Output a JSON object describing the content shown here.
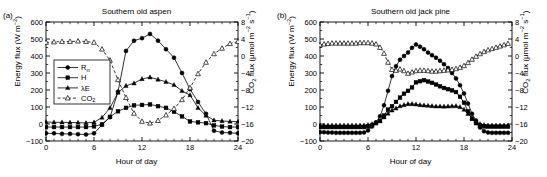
{
  "figure": {
    "panels": [
      {
        "label": "(a)",
        "title": "Southern old aspen",
        "xlabel": "Hour of day",
        "ylabel_left": "Energy flux (W m⁻²)",
        "ylabel_right": "CO₂ flux (μmol m⁻² s⁻¹)",
        "legend": [
          {
            "key": "Rn",
            "label": "R",
            "sub": "n",
            "marker": "circle",
            "line": "solid"
          },
          {
            "key": "H",
            "label": "H",
            "sub": "",
            "marker": "square",
            "line": "solid"
          },
          {
            "key": "LE",
            "label": "λE",
            "sub": "",
            "marker": "triangle",
            "line": "solid"
          },
          {
            "key": "CO2",
            "label": "CO",
            "sub": "2",
            "marker": "open-triangle",
            "line": "dashed"
          }
        ]
      },
      {
        "label": "(b)",
        "title": "Southern old jack pine",
        "xlabel": "Hour of day",
        "ylabel_left": "Energy flux (W m⁻²)",
        "ylabel_right": "CO₂ flux (μmol m⁻² s⁻¹)",
        "legend": []
      }
    ],
    "xticks": [
      0,
      6,
      12,
      18,
      24
    ],
    "yticks_left": [
      -100,
      0,
      100,
      200,
      300,
      400,
      500,
      600
    ],
    "yticks_right": [
      -20,
      -16,
      -12,
      -8,
      -4,
      0,
      4,
      8
    ],
    "colors": {
      "line": "#000000",
      "axis": "#000000",
      "background": "#ffffff"
    }
  },
  "chart_data": [
    {
      "type": "line",
      "panel": "a",
      "title": "Southern old aspen",
      "xlabel": "Hour of day",
      "ylabel": "Energy flux (W m⁻²)",
      "ylabel2": "CO₂ flux (μmol m⁻² s⁻¹)",
      "xlim": [
        0,
        24
      ],
      "ylim": [
        -100,
        600
      ],
      "ylim2": [
        -20,
        8
      ],
      "grid": false,
      "legend_position": "upper-left-inset",
      "x": [
        0,
        1,
        2,
        3,
        4,
        5,
        6,
        7,
        8,
        9,
        10,
        11,
        12,
        13,
        14,
        15,
        16,
        17,
        18,
        19,
        20,
        21,
        22,
        23,
        24
      ],
      "series": [
        {
          "name": "Rn",
          "axis": "left",
          "marker": "filled-circle",
          "line": "solid",
          "values": [
            -55,
            -55,
            -58,
            -58,
            -60,
            -62,
            -55,
            -5,
            40,
            190,
            430,
            490,
            505,
            530,
            490,
            440,
            390,
            300,
            205,
            130,
            60,
            -40,
            -50,
            -52,
            -55
          ]
        },
        {
          "name": "H",
          "axis": "left",
          "marker": "filled-square",
          "line": "solid",
          "values": [
            -18,
            -18,
            -18,
            -18,
            -18,
            -18,
            -14,
            -2,
            42,
            75,
            95,
            110,
            112,
            115,
            105,
            95,
            72,
            45,
            15,
            10,
            5,
            -8,
            -15,
            -18,
            -18
          ]
        },
        {
          "name": "λE",
          "axis": "left",
          "marker": "filled-triangle",
          "line": "solid",
          "values": [
            12,
            10,
            10,
            9,
            8,
            6,
            10,
            38,
            95,
            185,
            225,
            240,
            265,
            275,
            262,
            248,
            230,
            195,
            170,
            95,
            50,
            22,
            18,
            15,
            14
          ]
        },
        {
          "name": "CO₂",
          "axis": "right",
          "marker": "open-triangle",
          "line": "dashed",
          "values": [
            3.2,
            3.3,
            3.4,
            3.4,
            3.5,
            3.4,
            3.2,
            1.6,
            -1.0,
            -5.6,
            -9.8,
            -13.5,
            -15.4,
            -15.8,
            -15.2,
            -13.9,
            -12.4,
            -10.3,
            -7.5,
            -4.2,
            -1.5,
            0.5,
            1.8,
            2.9,
            3.4
          ]
        }
      ]
    },
    {
      "type": "line",
      "panel": "b",
      "title": "Southern old jack pine",
      "xlabel": "Hour of day",
      "ylabel": "Energy flux (W m⁻²)",
      "ylabel2": "CO₂ flux (μmol m⁻² s⁻¹)",
      "xlim": [
        0,
        24
      ],
      "ylim": [
        -100,
        600
      ],
      "ylim2": [
        -20,
        8
      ],
      "grid": false,
      "legend_position": "none",
      "x": [
        0,
        0.5,
        1,
        1.5,
        2,
        2.5,
        3,
        3.5,
        4,
        4.5,
        5,
        5.5,
        6,
        6.5,
        7,
        7.5,
        8,
        8.5,
        9,
        9.5,
        10,
        10.5,
        11,
        11.5,
        12,
        12.5,
        13,
        13.5,
        14,
        14.5,
        15,
        15.5,
        16,
        16.5,
        17,
        17.5,
        18,
        18.5,
        19,
        19.5,
        20,
        20.5,
        21,
        21.5,
        22,
        22.5,
        23,
        23.5
      ],
      "series": [
        {
          "name": "Rn",
          "axis": "left",
          "marker": "filled-circle",
          "line": "solid",
          "values": [
            -48,
            -48,
            -50,
            -50,
            -52,
            -52,
            -52,
            -52,
            -52,
            -52,
            -52,
            -50,
            -38,
            -15,
            10,
            45,
            110,
            195,
            282,
            340,
            378,
            400,
            420,
            448,
            468,
            455,
            440,
            420,
            405,
            390,
            372,
            352,
            330,
            300,
            268,
            228,
            180,
            120,
            60,
            20,
            -20,
            -42,
            -50,
            -52,
            -52,
            -52,
            -52,
            -52
          ]
        },
        {
          "name": "H",
          "axis": "left",
          "marker": "filled-square",
          "line": "solid",
          "values": [
            -18,
            -18,
            -18,
            -18,
            -18,
            -18,
            -18,
            -18,
            -18,
            -18,
            -18,
            -18,
            -14,
            -6,
            5,
            18,
            50,
            85,
            105,
            130,
            155,
            178,
            195,
            215,
            245,
            252,
            258,
            250,
            242,
            232,
            222,
            212,
            205,
            198,
            188,
            160,
            125,
            75,
            30,
            5,
            -8,
            -14,
            -16,
            -16,
            -16,
            -16,
            -16,
            -16
          ]
        },
        {
          "name": "λE",
          "axis": "left",
          "marker": "filled-triangle",
          "line": "solid",
          "values": [
            -8,
            -8,
            -8,
            -8,
            -8,
            -8,
            -8,
            -8,
            -8,
            -8,
            -8,
            -8,
            -5,
            0,
            8,
            18,
            40,
            62,
            80,
            92,
            105,
            112,
            118,
            118,
            116,
            112,
            110,
            108,
            106,
            104,
            104,
            103,
            104,
            105,
            106,
            100,
            85,
            60,
            35,
            15,
            0,
            -6,
            -8,
            -8,
            -8,
            -8,
            -8,
            -8
          ]
        },
        {
          "name": "CO₂",
          "axis": "right",
          "marker": "open-triangle",
          "line": "dashed",
          "values": [
            2.6,
            2.8,
            2.9,
            3.0,
            3.0,
            3.0,
            3.0,
            3.0,
            3.0,
            3.0,
            3.1,
            3.1,
            3.1,
            3.0,
            2.8,
            2.0,
            0.6,
            -1.5,
            -3.2,
            -3.4,
            -3.1,
            -3.5,
            -4.1,
            -3.8,
            -3.5,
            -3.4,
            -3.4,
            -3.5,
            -3.6,
            -3.6,
            -3.5,
            -3.4,
            -3.3,
            -3.2,
            -3.0,
            -2.7,
            -2.3,
            -1.6,
            -0.8,
            -0.1,
            0.5,
            1.0,
            1.4,
            1.7,
            2.0,
            2.3,
            2.6,
            2.9
          ]
        }
      ]
    }
  ]
}
